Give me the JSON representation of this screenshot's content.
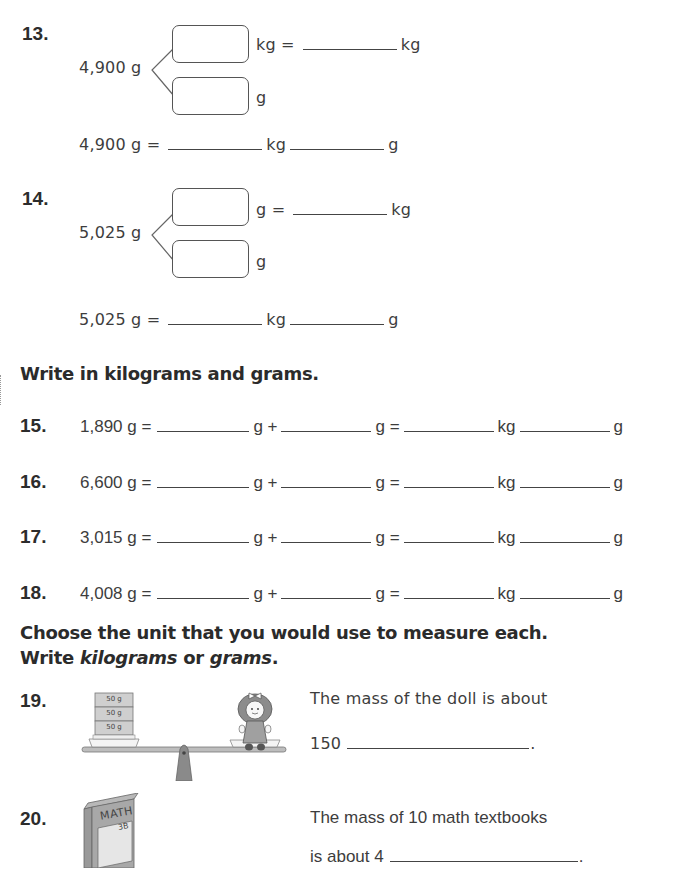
{
  "page": {
    "partial_title": "Group",
    "sections": {
      "write_kg_g": "Write in kilograms and grams.",
      "choose_unit_line1": "Choose the unit that you would use to measure each.",
      "choose_unit_line2_prefix": "Write ",
      "choose_unit_kilograms": "kilograms",
      "choose_unit_or": " or ",
      "choose_unit_grams": "grams",
      "choose_unit_period": "."
    }
  },
  "problems": {
    "p13": {
      "number": "13.",
      "total": "4,900 g",
      "top_box_unit": "kg =",
      "top_result_unit": "kg",
      "bottom_box_unit": "g",
      "eq_left": "4,900 g =",
      "eq_kg": "kg",
      "eq_g": "g"
    },
    "p14": {
      "number": "14.",
      "total": "5,025 g",
      "top_box_unit": "g =",
      "top_result_unit": "kg",
      "bottom_box_unit": "g",
      "eq_left": "5,025 g =",
      "eq_kg": "kg",
      "eq_g": "g"
    },
    "conversions": [
      {
        "number": "15.",
        "left": "1,890 g =",
        "g_plus": "g +",
        "g_eq": "g =",
        "kg": "kg",
        "g": "g"
      },
      {
        "number": "16.",
        "left": "6,600 g =",
        "g_plus": "g +",
        "g_eq": "g =",
        "kg": "kg",
        "g": "g"
      },
      {
        "number": "17.",
        "left": "3,015 g =",
        "g_plus": "g +",
        "g_eq": "g =",
        "kg": "kg",
        "g": "g"
      },
      {
        "number": "18.",
        "left": "4,008 g =",
        "g_plus": "g +",
        "g_eq": "g =",
        "kg": "kg",
        "g": "g"
      }
    ],
    "p19": {
      "number": "19.",
      "line1": "The mass of the doll is about",
      "line2_prefix": "150",
      "line2_suffix": ".",
      "weights": [
        "50 g",
        "50 g",
        "50 g"
      ]
    },
    "p20": {
      "number": "20.",
      "line1": "The mass of 10 math textbooks",
      "line2_prefix": "is about 4",
      "line2_suffix": ".",
      "book_title": "MATH",
      "book_label": "3B"
    }
  }
}
